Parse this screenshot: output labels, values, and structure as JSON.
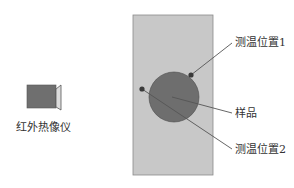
{
  "diagram": {
    "camera": {
      "label": "红外热像仪",
      "icon": "infrared-camera-icon",
      "body_color": "#6f6f6f",
      "lens_color": "#dcdcdc"
    },
    "plate": {
      "color": "#c8c8c8",
      "border": "#8a8a8a"
    },
    "sample": {
      "label": "样品",
      "color": "#6e6e6e"
    },
    "points": [
      {
        "label": "测温位置1"
      },
      {
        "label": "测温位置2"
      }
    ],
    "leader_color": "#555555"
  }
}
